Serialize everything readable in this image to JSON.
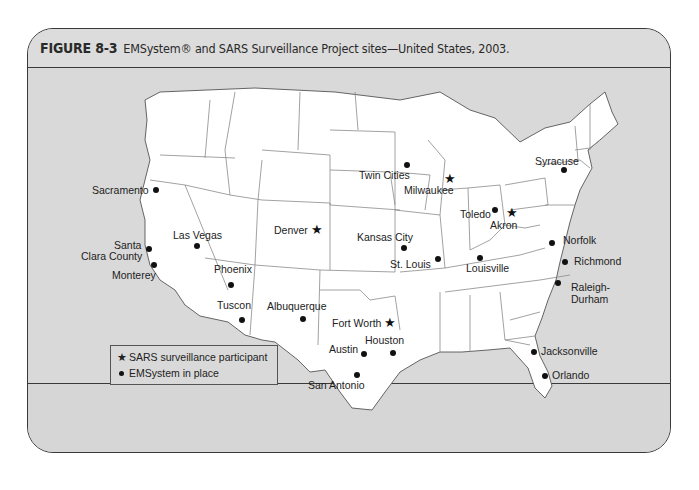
{
  "figure": {
    "label": "FIGURE 8-3",
    "caption": "EMSystem® and SARS Surveillance Project sites—United States, 2003."
  },
  "legend": {
    "items": [
      {
        "symbol": "star",
        "glyph": "★",
        "label": "SARS surveillance participant"
      },
      {
        "symbol": "dot",
        "glyph": "●",
        "label": "EMSystem in place"
      }
    ]
  },
  "colors": {
    "frame_bg": "#dcdcdc",
    "land": "#ffffff",
    "border_line": "#3a3a3a",
    "state_line": "#888888",
    "marker": "#111111"
  },
  "cities": [
    {
      "name": "Sacramento",
      "type": "dot",
      "label_lines": [
        "Sacramento"
      ]
    },
    {
      "name": "Santa Clara County",
      "type": "dot",
      "label_lines": [
        "Santa",
        "Clara County"
      ]
    },
    {
      "name": "Monterey",
      "type": "dot",
      "label_lines": [
        "Monterey"
      ]
    },
    {
      "name": "Las Vegas",
      "type": "dot",
      "label_lines": [
        "Las Vegas"
      ]
    },
    {
      "name": "Phoenix",
      "type": "dot",
      "label_lines": [
        "Phoenix"
      ]
    },
    {
      "name": "Tuscon",
      "type": "dot",
      "label_lines": [
        "Tuscon"
      ]
    },
    {
      "name": "Denver",
      "type": "star",
      "label_lines": [
        "Denver"
      ]
    },
    {
      "name": "Albuquerque",
      "type": "dot",
      "label_lines": [
        "Albuquerque"
      ]
    },
    {
      "name": "Fort Worth",
      "type": "star",
      "label_lines": [
        "Fort Worth"
      ]
    },
    {
      "name": "Austin",
      "type": "dot",
      "label_lines": [
        "Austin"
      ]
    },
    {
      "name": "Houston",
      "type": "dot",
      "label_lines": [
        "Houston"
      ]
    },
    {
      "name": "San Antonio",
      "type": "dot",
      "label_lines": [
        "San Antonio"
      ]
    },
    {
      "name": "Kansas City",
      "type": "dot",
      "label_lines": [
        "Kansas City"
      ]
    },
    {
      "name": "St. Louis",
      "type": "dot",
      "label_lines": [
        "St. Louis"
      ]
    },
    {
      "name": "Twin Cities",
      "type": "dot",
      "label_lines": [
        "Twin Cities"
      ]
    },
    {
      "name": "Milwaukee",
      "type": "star",
      "label_lines": [
        "Milwaukee"
      ]
    },
    {
      "name": "Toledo",
      "type": "dot",
      "label_lines": [
        "Toledo"
      ]
    },
    {
      "name": "Akron",
      "type": "star",
      "label_lines": [
        "Akron"
      ]
    },
    {
      "name": "Louisville",
      "type": "dot",
      "label_lines": [
        "Louisville"
      ]
    },
    {
      "name": "Syracuse",
      "type": "dot",
      "label_lines": [
        "Syracuse"
      ]
    },
    {
      "name": "Norfolk",
      "type": "dot",
      "label_lines": [
        "Norfolk"
      ]
    },
    {
      "name": "Richmond",
      "type": "dot",
      "label_lines": [
        "Richmond"
      ]
    },
    {
      "name": "Raleigh-Durham",
      "type": "dot",
      "label_lines": [
        "Raleigh-",
        "Durham"
      ]
    },
    {
      "name": "Jacksonville",
      "type": "dot",
      "label_lines": [
        "Jacksonville"
      ]
    },
    {
      "name": "Orlando",
      "type": "dot",
      "label_lines": [
        "Orlando"
      ]
    }
  ]
}
